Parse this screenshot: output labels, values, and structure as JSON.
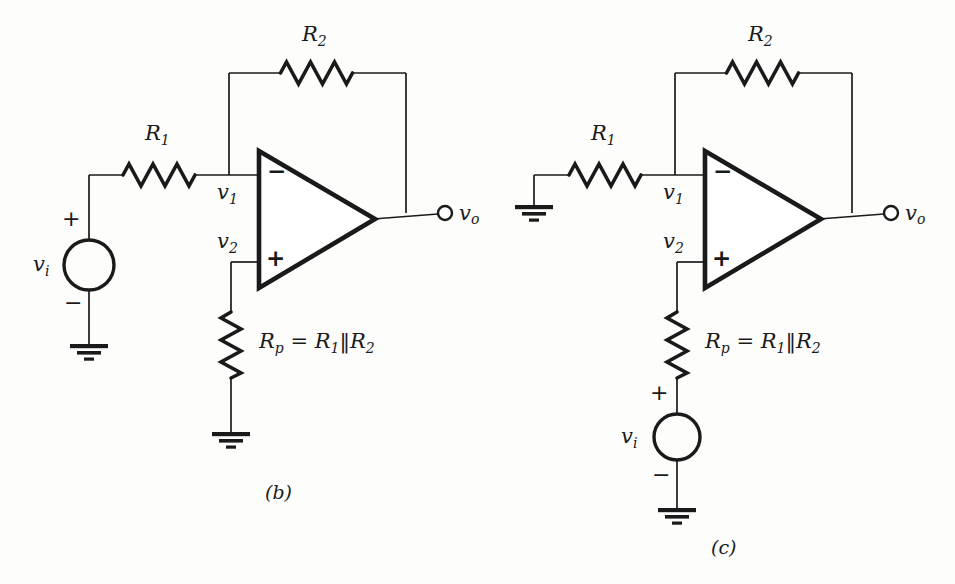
{
  "figure": {
    "kind": "circuit-schematic",
    "stroke_color": "#1a1a1a",
    "background": "#fdfdfc",
    "panels": [
      {
        "caption": "(b)",
        "id": "panel-b",
        "description": "Inverting amplifier with input source at R1 and Rp to ground",
        "labels": {
          "r1": "R",
          "r1_sub": "1",
          "r2": "R",
          "r2_sub": "2",
          "v1": "v",
          "v1_sub": "1",
          "v2": "v",
          "v2_sub": "2",
          "vo": "v",
          "vo_sub": "o",
          "vi": "v",
          "vi_sub": "i",
          "rp_expr_lead": "R",
          "rp_expr_lead_sub": "p",
          "rp_expr_mid": " = R",
          "rp_expr_mid_sub": "1",
          "rp_expr_bar": "‖R",
          "rp_expr_tail_sub": "2",
          "plus": "+",
          "minus": "−",
          "opamp_minus": "−",
          "opamp_plus": "+"
        }
      },
      {
        "caption": "(c)",
        "id": "panel-c",
        "description": "Non-inverting configuration with R1 grounded and source in series with Rp",
        "labels": {
          "r1": "R",
          "r1_sub": "1",
          "r2": "R",
          "r2_sub": "2",
          "v1": "v",
          "v1_sub": "1",
          "v2": "v",
          "v2_sub": "2",
          "vo": "v",
          "vo_sub": "o",
          "vi": "v",
          "vi_sub": "i",
          "rp_expr_lead": "R",
          "rp_expr_lead_sub": "p",
          "rp_expr_mid": " = R",
          "rp_expr_mid_sub": "1",
          "rp_expr_bar": "‖R",
          "rp_expr_tail_sub": "2",
          "plus": "+",
          "minus": "−",
          "opamp_minus": "−",
          "opamp_plus": "+"
        }
      }
    ]
  }
}
